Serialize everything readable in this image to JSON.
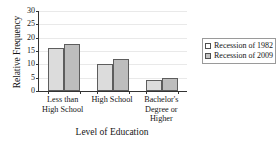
{
  "chart_data": {
    "type": "bar",
    "title": "",
    "xlabel": "Level of Education",
    "ylabel": "Relative Frequency",
    "categories": [
      "Less than High School",
      "High School",
      "Bachelor's Degree or Higher"
    ],
    "series": [
      {
        "name": "Recession of 1982",
        "values": [
          16,
          10,
          4
        ],
        "color": "#dcdcdc"
      },
      {
        "name": "Recession of 2009",
        "values": [
          17.7,
          12,
          5
        ],
        "color": "#bdbdbd"
      }
    ],
    "ylim": [
      0,
      30
    ],
    "yticks": [
      0,
      5,
      10,
      15,
      20,
      25,
      30
    ],
    "ytick_labels": [
      "0",
      "5",
      "10",
      "15",
      "20",
      "25",
      "30"
    ],
    "grid": true,
    "legend_position": "right"
  },
  "legend": {
    "entries": [
      {
        "label": "Recession of 1982"
      },
      {
        "label": "Recession of 2009"
      }
    ]
  }
}
